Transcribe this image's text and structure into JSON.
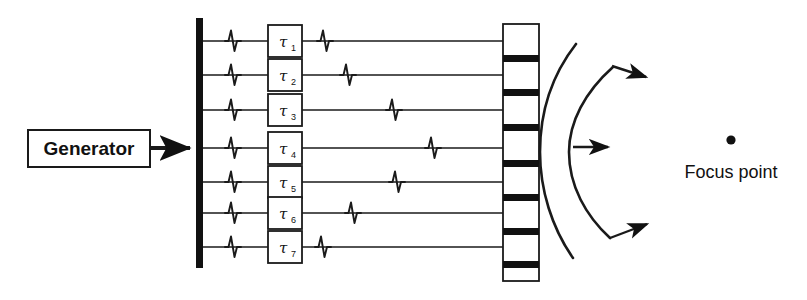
{
  "figure": {
    "background_color": "#ffffff",
    "ink_color": "#1a1a1a",
    "width": 807,
    "height": 300
  },
  "generator": {
    "label": "Generator",
    "box": {
      "x": 28,
      "y": 130,
      "w": 122,
      "h": 37
    },
    "feed_arrow": {
      "x1": 150,
      "y1": 148,
      "x2": 194,
      "y2": 148
    }
  },
  "bus_bar": {
    "name": "common-excitation-bus",
    "x": 196,
    "y": 18,
    "w": 7,
    "h": 250,
    "color": "#111111"
  },
  "channels": {
    "count": 7,
    "first_row_y": 41,
    "row_spacing": 34.5,
    "line_start_x": 203,
    "line_end_x": 503,
    "input_pulse_x": 232,
    "delay_box": {
      "x": 268,
      "y_offset": -16,
      "w": 34,
      "h": 32
    },
    "items": [
      {
        "id": 1,
        "label": "τ",
        "subscript": "1",
        "row_y": 41,
        "output_pulse_x": 324
      },
      {
        "id": 2,
        "label": "τ",
        "subscript": "2",
        "row_y": 75,
        "output_pulse_x": 347
      },
      {
        "id": 3,
        "label": "τ",
        "subscript": "3",
        "row_y": 110,
        "output_pulse_x": 393
      },
      {
        "id": 4,
        "label": "τ",
        "subscript": "4",
        "row_y": 148,
        "output_pulse_x": 432
      },
      {
        "id": 5,
        "label": "τ",
        "subscript": "5",
        "row_y": 182,
        "output_pulse_x": 396
      },
      {
        "id": 6,
        "label": "τ",
        "subscript": "6",
        "row_y": 213,
        "output_pulse_x": 352
      },
      {
        "id": 7,
        "label": "τ",
        "subscript": "7",
        "row_y": 247,
        "output_pulse_x": 322
      }
    ]
  },
  "transducer_array": {
    "name": "transducer-array",
    "outline": {
      "x": 503,
      "y": 24,
      "w": 36,
      "h": 257
    },
    "element_separator_color": "#111111",
    "separator_thickness": 7,
    "separator_y_positions": [
      58,
      92,
      127,
      163,
      197,
      231,
      264
    ],
    "element_count": 8
  },
  "wavefronts": {
    "name": "converging-wavefronts",
    "arc_count": 2,
    "arcs": [
      {
        "id": "outer-wavefront",
        "start_x": 575,
        "start_y": 45,
        "ctrl_x": 539,
        "ctrl_y": 152,
        "end_x": 572,
        "end_y": 257
      },
      {
        "id": "inner-wavefront",
        "start_x": 612,
        "start_y": 66,
        "ctrl_x": 568,
        "ctrl_y": 152,
        "end_x": 609,
        "end_y": 238
      }
    ],
    "arrows": [
      {
        "id": "upper-propagation-arrow",
        "x1": 612,
        "y1": 66,
        "x2": 651,
        "y2": 78
      },
      {
        "id": "center-propagation-arrow",
        "x1": 573,
        "y1": 147,
        "x2": 613,
        "y2": 147
      },
      {
        "id": "lower-propagation-arrow",
        "x1": 610,
        "y1": 237,
        "x2": 652,
        "y2": 222
      }
    ]
  },
  "focus": {
    "label": "Focus point",
    "dot": {
      "cx": 731,
      "cy": 140,
      "r": 4.5
    },
    "label_position": {
      "x": 731,
      "y": 172
    }
  }
}
